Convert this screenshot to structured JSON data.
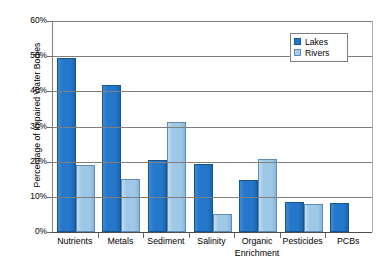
{
  "chart_data": {
    "type": "bar",
    "title": "",
    "xlabel": "",
    "ylabel": "Percentage of Impaired Water Bodies",
    "ylim": [
      0,
      60
    ],
    "ytick_labels": [
      "0%",
      "10%",
      "20%",
      "30%",
      "40%",
      "50%",
      "60%"
    ],
    "ytick_values": [
      0,
      10,
      20,
      30,
      40,
      50,
      60
    ],
    "grid": true,
    "legend_position": "top-right",
    "categories": [
      "Nutrients",
      "Metals",
      "Sediment",
      "Salinity",
      "Organic Enrichment",
      "Pesticides",
      "PCBs"
    ],
    "category_label_lines": [
      [
        "Nutrients",
        ""
      ],
      [
        "Metals",
        ""
      ],
      [
        "Sediment",
        ""
      ],
      [
        "Salinity",
        ""
      ],
      [
        "Organic",
        "Enrichment"
      ],
      [
        "Pesticides",
        ""
      ],
      [
        "PCBs",
        ""
      ]
    ],
    "series": [
      {
        "name": "Lakes",
        "color": "#2477c9",
        "values": [
          49.6,
          41.8,
          20.5,
          19.3,
          14.8,
          8.5,
          8.2
        ]
      },
      {
        "name": "Rivers",
        "color": "#a6cce8",
        "values": [
          19.1,
          15.2,
          31.2,
          5.2,
          20.7,
          8.0,
          null
        ]
      }
    ]
  },
  "legend": {
    "items": [
      {
        "label": "Lakes",
        "swatch": "lakes-swatch-icon"
      },
      {
        "label": "Rivers",
        "swatch": "rivers-swatch-icon"
      }
    ]
  },
  "colors": {
    "lakes": "#2477c9",
    "lakes_edge": "#17538f",
    "rivers": "#a6cce8",
    "rivers_edge": "#5f8cb5",
    "gridline": "#7f7f7f",
    "axis": "#4d4d4d",
    "background": "#ffffff",
    "text": "#000000"
  }
}
